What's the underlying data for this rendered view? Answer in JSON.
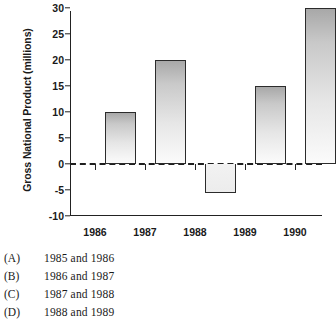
{
  "chart_data": {
    "type": "bar",
    "title": "",
    "xlabel": "",
    "ylabel": "Gross National Product (millions)",
    "categories": [
      "1986",
      "1987",
      "1988",
      "1989",
      "1990"
    ],
    "values": [
      10,
      20,
      -5.5,
      15,
      30
    ],
    "bar_labels": [
      "1986",
      "1987",
      "1988",
      "1989",
      "1990"
    ],
    "ylim": [
      -10,
      30
    ],
    "yticks": [
      30,
      25,
      20,
      15,
      10,
      5,
      0,
      -5,
      -10
    ],
    "ytick_labels": [
      "30",
      "25",
      "20",
      "15",
      "10",
      "5",
      "0",
      "-5",
      "-10"
    ],
    "xtick_labels": [
      "1986",
      "1987",
      "1988",
      "1989",
      "1990"
    ],
    "grid": false,
    "legend": false,
    "zero_line": "dashed",
    "bar_fill": "vertical gradient gray-to-white",
    "outline_color": "#2b2b2b"
  },
  "answers": {
    "options": [
      {
        "letter": "(A)",
        "text": "1985 and 1986"
      },
      {
        "letter": "(B)",
        "text": "1986 and 1987"
      },
      {
        "letter": "(C)",
        "text": "1987 and 1988"
      },
      {
        "letter": "(D)",
        "text": "1988 and 1989"
      }
    ]
  }
}
